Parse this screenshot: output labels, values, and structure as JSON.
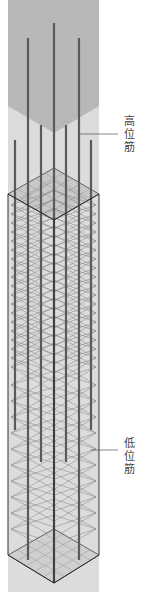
{
  "diagram": {
    "labels": {
      "high_bars": "高位筋",
      "low_bars": "低位筋"
    },
    "colors": {
      "upper_zone": "#b8b8b8",
      "lower_zone": "#dcdcdc",
      "rebar": "#5a5a5a",
      "stirrup": "#7a7a7a",
      "outline": "#333333",
      "leader_line": "#555555"
    }
  }
}
